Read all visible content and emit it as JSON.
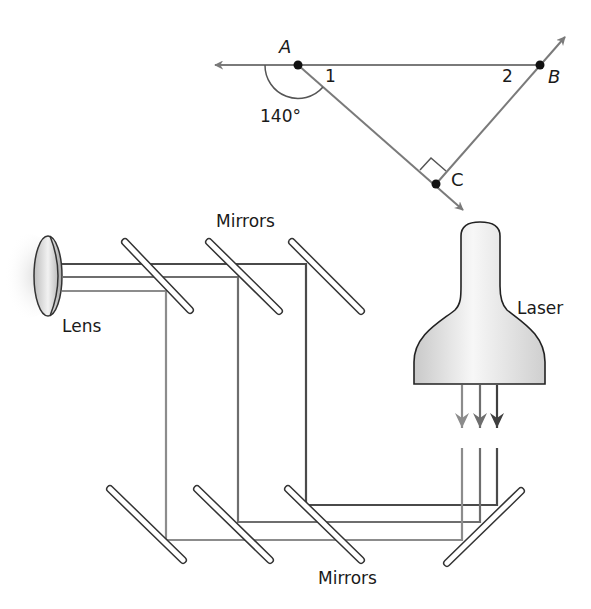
{
  "triangle": {
    "vertices": [
      {
        "name": "A",
        "label": "A"
      },
      {
        "name": "B",
        "label": "B"
      },
      {
        "name": "C",
        "label": "C"
      }
    ],
    "angle_labels": {
      "angle1": "1",
      "angle2": "2"
    },
    "exterior_angle": "140°",
    "right_angle_at": "C"
  },
  "optics": {
    "lens_label": "Lens",
    "laser_label": "Laser",
    "mirrors_top_label": "Mirrors",
    "mirrors_bottom_label": "Mirrors"
  },
  "colors": {
    "line_gray": "#7a7a7a",
    "beam_dark": "#4a4a4a",
    "beam_mid": "#6e6e6e",
    "beam_light": "#8c8c8c",
    "text": "#1a1a1a"
  }
}
